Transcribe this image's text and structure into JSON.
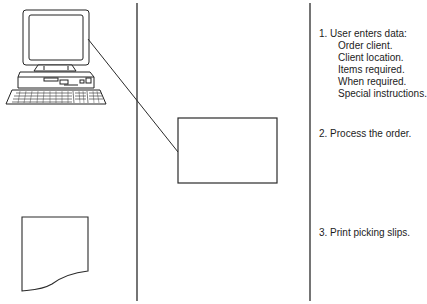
{
  "diagram": {
    "type": "process-flow",
    "columns": [
      "devices",
      "processing",
      "steps"
    ],
    "steps": [
      {
        "number": "1.",
        "label": "1. User enters data:",
        "sub_items": [
          "Order client.",
          "Client location.",
          "Items required.",
          "When required.",
          "Special instructions."
        ]
      },
      {
        "number": "2.",
        "label": "2. Process the order.",
        "sub_items": []
      },
      {
        "number": "3.",
        "label": "3. Print picking slips.",
        "sub_items": []
      }
    ],
    "icons": {
      "computer": "desktop-computer-icon",
      "process": "process-box",
      "document": "printed-document-icon"
    },
    "colors": {
      "line": "#2a2a2a",
      "background": "#ffffff"
    }
  }
}
